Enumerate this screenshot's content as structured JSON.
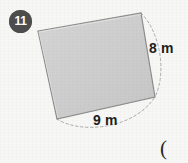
{
  "page": {
    "background_color": "#f7f7f5",
    "width": 188,
    "height": 163
  },
  "problem": {
    "number_badge": "11",
    "badge_color": "#4d4d4d",
    "badge_text_color": "#ffffff"
  },
  "figure": {
    "shape_name": "tilted-square-quadrilateral",
    "fill_color": "#cdcdcd",
    "stroke_color": "#8d8d8d",
    "vertices": [
      {
        "x": 38,
        "y": 31
      },
      {
        "x": 141,
        "y": 13
      },
      {
        "x": 155,
        "y": 97
      },
      {
        "x": 57,
        "y": 119
      }
    ],
    "dimension_labels": [
      {
        "id": "right-side",
        "text": "8 m",
        "value": 8,
        "unit": "m"
      },
      {
        "id": "bottom-side",
        "text": "9 m",
        "value": 9,
        "unit": "m"
      }
    ],
    "arc_style": "dashed",
    "arc_color": "#a8a8a8"
  },
  "trailing_text": {
    "paren": "("
  }
}
